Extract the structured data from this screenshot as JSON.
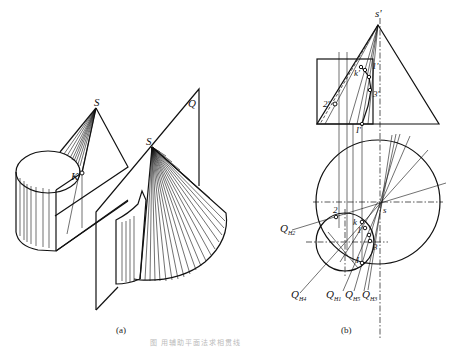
{
  "figure": {
    "panels": [
      {
        "id": "a",
        "caption": "(a)",
        "description": "Isometric view: cylinder and cone intersecting, auxiliary cutting plane Q through apex S",
        "labels": {
          "apex_left": "S",
          "point_k": "K",
          "apex_right": "S",
          "plane": "Q"
        }
      },
      {
        "id": "b",
        "caption": "(b)",
        "description": "Orthographic projections: front view (cone triangle + cylinder rectangle) and top view (circles) with cutting-plane traces",
        "labels": {
          "front_apex": "s'",
          "front_k": "k'",
          "front_1": "1'",
          "front_2": "2'",
          "front_3": "3'",
          "front_I": "I'",
          "top_apex": "s",
          "top_k": "k",
          "top_1": "1",
          "top_2": "2",
          "top_3": "3",
          "top_I": "I",
          "traces": [
            {
              "main": "Q",
              "sub": "H2"
            },
            {
              "main": "Q",
              "sub": "H4"
            },
            {
              "main": "Q",
              "sub": "H1"
            },
            {
              "main": "Q",
              "sub": "H5"
            },
            {
              "main": "Q",
              "sub": "H3"
            }
          ]
        }
      }
    ],
    "bottom_caption": "图 用辅助平面法求相贯线"
  }
}
